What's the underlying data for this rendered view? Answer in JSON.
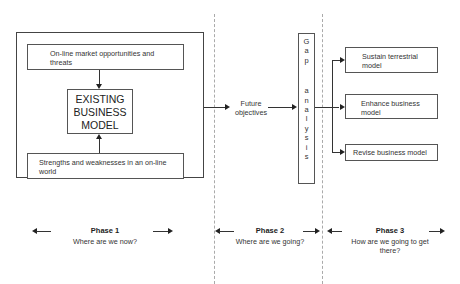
{
  "diagram": {
    "phase1": {
      "threats_box": "On-line market opportunities and threats",
      "existing_model": [
        "EXISTING",
        "BUSINESS",
        "MODEL"
      ],
      "strengths_box": "Strengths and weaknesses in an on-line world"
    },
    "phase2": {
      "future_objectives": [
        "Future",
        "objectives"
      ],
      "gap_analysis": [
        "G",
        "a",
        "p",
        "",
        "a",
        "n",
        "a",
        "l",
        "y",
        "s",
        "i",
        "s"
      ]
    },
    "phase3": {
      "outcomes": [
        "Sustain terrestrial model",
        "Enhance business model",
        "Revise business model"
      ]
    },
    "phase_labels": [
      {
        "title": "Phase 1",
        "subtitle": "Where are we now?"
      },
      {
        "title": "Phase 2",
        "subtitle": "Where are we going?"
      },
      {
        "title": "Phase 3",
        "subtitle": "How are we going to get there?"
      }
    ]
  }
}
